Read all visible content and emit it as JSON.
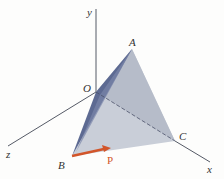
{
  "figure": {
    "axes": {
      "x_label": "x",
      "y_label": "y",
      "z_label": "z",
      "origin_label": "O"
    },
    "vertices": {
      "A": "A",
      "B": "B",
      "C": "C"
    },
    "force": {
      "label": "P",
      "color": "#d2552a"
    },
    "colors": {
      "face_light": "#c9ced8",
      "face_dark": "#5d6a92",
      "axis": "#555a66"
    }
  }
}
